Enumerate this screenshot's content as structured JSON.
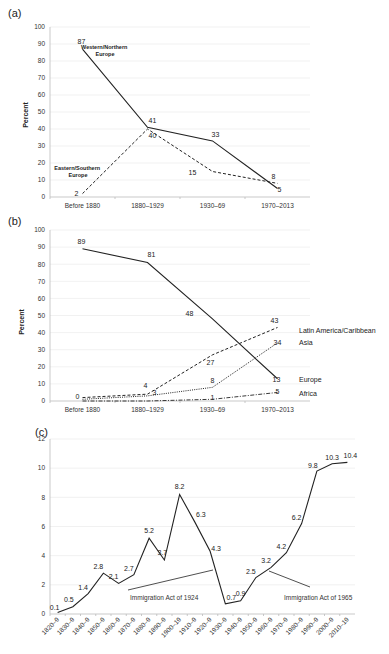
{
  "chart_data": [
    {
      "panel": "(a)",
      "type": "line",
      "title": "",
      "xlabel": "",
      "ylabel": "Percent",
      "ylim": [
        0,
        100
      ],
      "yticks": [
        0,
        10,
        20,
        30,
        40,
        50,
        60,
        70,
        80,
        90,
        100
      ],
      "grid": true,
      "categories": [
        "Before 1880",
        "1880–1929",
        "1930–69",
        "1970–2013"
      ],
      "series": [
        {
          "name": "Western/Northern Europe",
          "style": "solid",
          "values": [
            87,
            41,
            33,
            5
          ],
          "labels": [
            "87",
            "41",
            "33",
            "5"
          ]
        },
        {
          "name": "Eastern/Southern Europe",
          "style": "dashed",
          "values": [
            2,
            40,
            15,
            8
          ],
          "labels": [
            "2",
            "40",
            "15",
            "8"
          ]
        }
      ],
      "annotations": [
        {
          "text": "Western/Northern",
          "line2": "Europe"
        },
        {
          "text": "Eastern/Southern",
          "line2": "Europe"
        }
      ]
    },
    {
      "panel": "(b)",
      "type": "line",
      "title": "",
      "xlabel": "",
      "ylabel": "Percent",
      "ylim": [
        0,
        100
      ],
      "yticks": [
        0,
        10,
        20,
        30,
        40,
        50,
        60,
        70,
        80,
        90,
        100
      ],
      "grid": true,
      "categories": [
        "Before 1880",
        "1880–1929",
        "1930–69",
        "1970–2013"
      ],
      "legend_position": "right, at line ends",
      "series": [
        {
          "name": "Europe",
          "style": "solid",
          "values": [
            89,
            81,
            48,
            13
          ],
          "labels": [
            "89",
            "81",
            "48",
            "13"
          ]
        },
        {
          "name": "Latin America/Caribbean",
          "style": "dashed",
          "values": [
            2,
            4,
            27,
            43
          ],
          "labels": [
            "",
            "4",
            "27",
            "43"
          ]
        },
        {
          "name": "Asia",
          "style": "dotted",
          "values": [
            1,
            3,
            8,
            34
          ],
          "labels": [
            "0",
            "3",
            "8",
            "34"
          ]
        },
        {
          "name": "Africa",
          "style": "dashdot",
          "values": [
            0,
            0,
            1,
            5
          ],
          "labels": [
            "",
            "",
            "1",
            "5"
          ]
        }
      ]
    },
    {
      "panel": "(c)",
      "type": "line",
      "title": "",
      "xlabel": "",
      "ylabel": "",
      "ylim": [
        0,
        12
      ],
      "yticks": [
        0,
        2,
        4,
        6,
        8,
        10,
        12
      ],
      "grid": true,
      "categories": [
        "1820–9",
        "1830–9",
        "1840–9",
        "1850–9",
        "1860–9",
        "1870–9",
        "1880–9",
        "1890–9",
        "1900–19",
        "1910–9",
        "1920–9",
        "1930–9",
        "1940–9",
        "1950–9",
        "1960–9",
        "1970–9",
        "1980–9",
        "1990–9",
        "2000–9",
        "2010–19"
      ],
      "series": [
        {
          "name": "Immigrants",
          "style": "solid",
          "values": [
            0.1,
            0.5,
            1.4,
            2.8,
            2.1,
            2.7,
            5.2,
            3.7,
            8.2,
            6.3,
            4.3,
            0.7,
            0.9,
            2.5,
            3.2,
            4.2,
            6.2,
            9.8,
            10.3,
            10.4
          ],
          "labels": [
            "0.1",
            "0.5",
            "1.4",
            "2.8",
            "2.1",
            "2.7",
            "5.2",
            "3.7",
            "8.2",
            "6.3",
            "4.3",
            "0.7",
            "0.9",
            "2.5",
            "3.2",
            "4.2",
            "6.2",
            "9.8",
            "10.3",
            "10.4"
          ]
        }
      ],
      "annotations": [
        {
          "text": "Immigration Act of 1924",
          "points_to": "1920–9"
        },
        {
          "text": "Immigration Act of 1965",
          "points_to": "1960–9"
        }
      ]
    }
  ]
}
